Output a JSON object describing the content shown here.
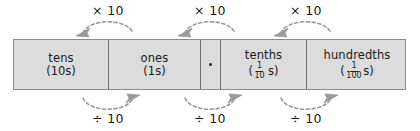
{
  "diagram": {
    "colors": {
      "cell_fill": "#dcdcdc",
      "cell_border": "#6f6f6f",
      "outer_border": "#8a8a8a",
      "arrow": "#9a9a9a",
      "text": "#1a1a1a",
      "background": "#ffffff"
    },
    "columns": [
      {
        "id": "tens",
        "label": "tens",
        "sub_prefix": "(",
        "sub_value": "10",
        "sub_suffix": "s)",
        "kind": "whole",
        "width": 95
      },
      {
        "id": "ones",
        "label": "ones",
        "sub_prefix": "(",
        "sub_value": "1",
        "sub_suffix": "s)",
        "kind": "whole",
        "width": 92
      },
      {
        "id": "decimal-point",
        "label": ".",
        "kind": "point",
        "width": 20
      },
      {
        "id": "tenths",
        "label": "tenths",
        "sub_prefix": "(",
        "numerator": "1",
        "denominator": "10",
        "sub_suffix": "s)",
        "kind": "fraction",
        "fraction_spaced": true,
        "width": 86
      },
      {
        "id": "hundredths",
        "label": "hundredths",
        "sub_prefix": "(",
        "numerator": "1",
        "denominator": "100",
        "sub_suffix": "s)",
        "kind": "fraction",
        "fraction_spaced": false,
        "width": 100
      }
    ],
    "arrows_top": [
      {
        "id": "multiply-1",
        "label": "× 10",
        "x": 108,
        "direction": "left"
      },
      {
        "id": "multiply-2",
        "label": "× 10",
        "x": 210,
        "direction": "left"
      },
      {
        "id": "multiply-3",
        "label": "× 10",
        "x": 306,
        "direction": "left"
      }
    ],
    "arrows_bottom": [
      {
        "id": "divide-1",
        "label": "÷ 10",
        "x": 108,
        "direction": "right"
      },
      {
        "id": "divide-2",
        "label": "÷ 10",
        "x": 210,
        "direction": "right"
      },
      {
        "id": "divide-3",
        "label": "÷ 10",
        "x": 306,
        "direction": "right"
      }
    ]
  }
}
